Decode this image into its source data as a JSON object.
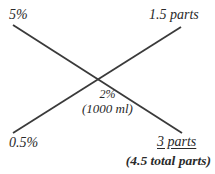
{
  "diagram": {
    "type": "alligation-pearson-square",
    "title_visible": false,
    "stroke_color": "#3a3a3a",
    "text_color": "#2a2a2a",
    "background_color": "#ffffff",
    "corners": {
      "top_left": "5%",
      "top_right": "1.5 parts",
      "bottom_left": "0.5%",
      "bottom_right": "3 parts"
    },
    "center": {
      "strength": "2%",
      "volume": "(1000 ml)"
    },
    "footer": "(4.5 total parts)"
  }
}
